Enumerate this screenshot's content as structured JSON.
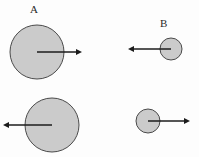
{
  "figure": {
    "background_color": "#fdfdfd",
    "circle_fill_color": "#cbcbcb",
    "circle_stroke_color": "#4a4a4a",
    "arrow_color": "#1c1c1c",
    "labels": {
      "a": "A",
      "b": "B"
    },
    "bodies": [
      {
        "id": "body-a-top",
        "label": "A",
        "size": "large",
        "cx": 37,
        "cy": 52,
        "r": 27,
        "arrow_direction": "right",
        "arrow_length": 45,
        "arrow_tip_x": 82
      },
      {
        "id": "body-b-top",
        "label": "B",
        "size": "small",
        "cx": 171,
        "cy": 49,
        "r": 11,
        "arrow_direction": "left",
        "arrow_length": 43,
        "arrow_tip_x": 128
      },
      {
        "id": "body-a-bottom",
        "label": "",
        "size": "large",
        "cx": 52,
        "cy": 125,
        "r": 27,
        "arrow_direction": "left",
        "arrow_length": 49,
        "arrow_tip_x": 3
      },
      {
        "id": "body-b-bottom",
        "label": "",
        "size": "small",
        "cx": 148,
        "cy": 121,
        "r": 12,
        "arrow_direction": "right",
        "arrow_length": 42,
        "arrow_tip_x": 190
      }
    ]
  }
}
